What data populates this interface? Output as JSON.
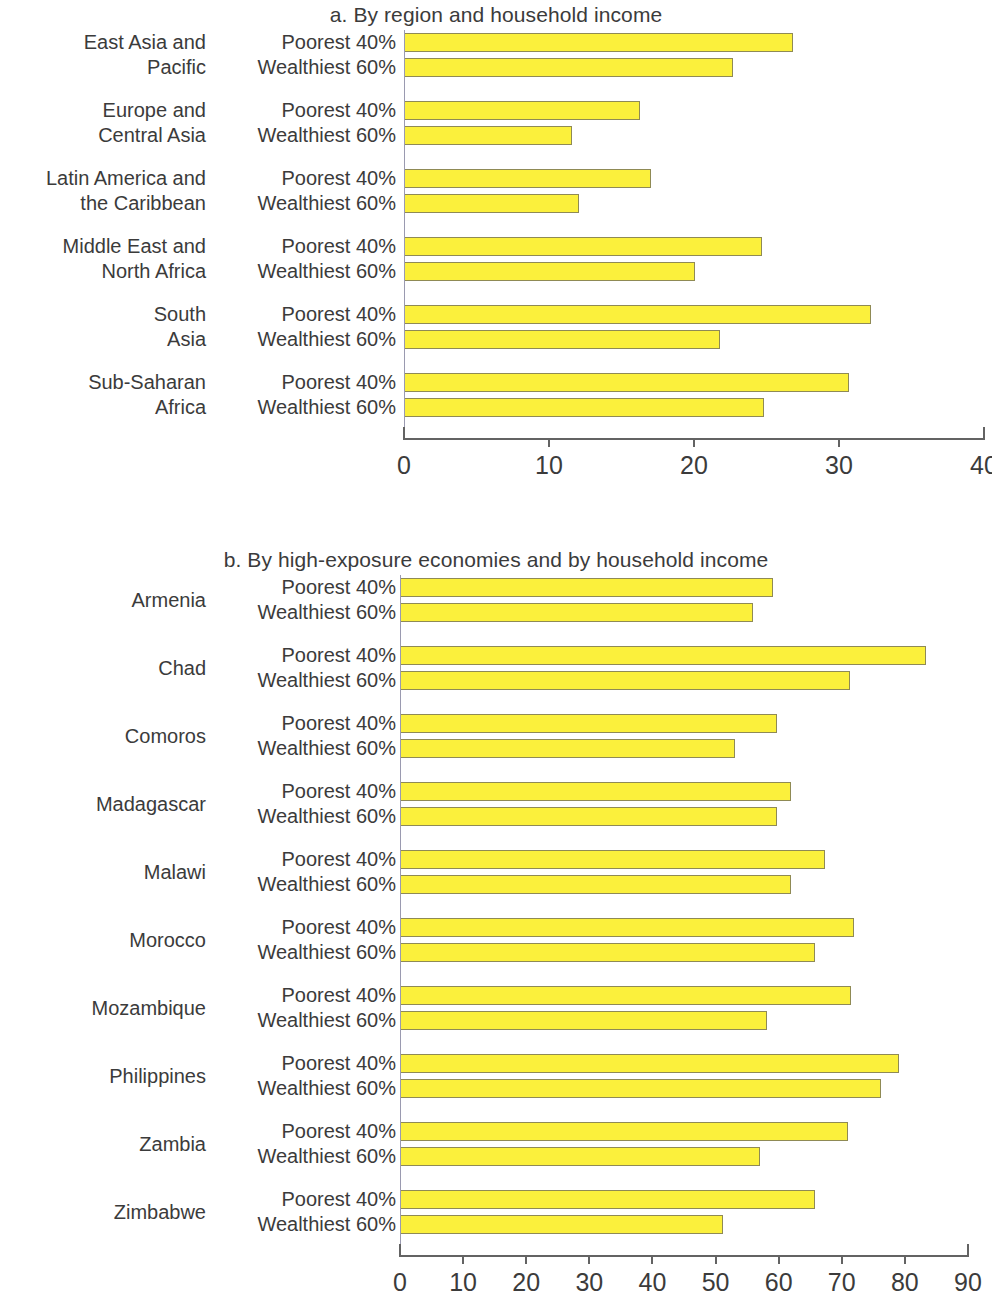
{
  "chart_data": [
    {
      "type": "bar",
      "orientation": "horizontal",
      "panel": "a",
      "title": "a. By region and household income",
      "xlabel": "",
      "ylabel": "",
      "xlim": [
        0,
        40
      ],
      "xticks": [
        0,
        10,
        20,
        30,
        40
      ],
      "grid": false,
      "legend": "none",
      "categories": [
        "East Asia and Pacific",
        "Europe and Central Asia",
        "Latin America and the Caribbean",
        "Middle East and North Africa",
        "South Asia",
        "Sub-Saharan Africa"
      ],
      "category_lines": [
        [
          "East Asia and",
          "Pacific"
        ],
        [
          "Europe and",
          "Central Asia"
        ],
        [
          "Latin America and",
          "the Caribbean"
        ],
        [
          "Middle East and",
          "North Africa"
        ],
        [
          "South",
          "Asia"
        ],
        [
          "Sub-Saharan",
          "Africa"
        ]
      ],
      "series": [
        {
          "name": "Poorest 40%",
          "values": [
            26.8,
            16.3,
            17.0,
            24.7,
            32.2,
            30.7
          ]
        },
        {
          "name": "Wealthiest 60%",
          "values": [
            22.7,
            11.6,
            12.1,
            20.1,
            21.8,
            24.8
          ]
        }
      ]
    },
    {
      "type": "bar",
      "orientation": "horizontal",
      "panel": "b",
      "title": "b. By high-exposure economies and by household income",
      "xlabel": "",
      "ylabel": "",
      "xlim": [
        0,
        90
      ],
      "xticks": [
        0,
        10,
        20,
        30,
        40,
        50,
        60,
        70,
        80,
        90
      ],
      "grid": false,
      "legend": "none",
      "categories": [
        "Armenia",
        "Chad",
        "Comoros",
        "Madagascar",
        "Malawi",
        "Morocco",
        "Mozambique",
        "Philippines",
        "Zambia",
        "Zimbabwe"
      ],
      "category_lines": [
        [
          "Armenia"
        ],
        [
          "Chad"
        ],
        [
          "Comoros"
        ],
        [
          "Madagascar"
        ],
        [
          "Malawi"
        ],
        [
          "Morocco"
        ],
        [
          "Mozambique"
        ],
        [
          "Philippines"
        ],
        [
          "Zambia"
        ],
        [
          "Zimbabwe"
        ]
      ],
      "series": [
        {
          "name": "Poorest 40%",
          "values": [
            59.1,
            83.3,
            59.8,
            61.9,
            67.4,
            72.0,
            71.5,
            79.1,
            71.0,
            65.8
          ]
        },
        {
          "name": "Wealthiest 60%",
          "values": [
            55.9,
            71.3,
            53.1,
            59.7,
            62.0,
            65.8,
            58.1,
            76.2,
            57.0,
            51.2
          ]
        }
      ]
    }
  ],
  "colors": {
    "bar_fill": "#fbf03c",
    "bar_stroke": "#8f8a55",
    "text": "#3b3b3b",
    "axis": "#636363",
    "background": "#ffffff"
  }
}
